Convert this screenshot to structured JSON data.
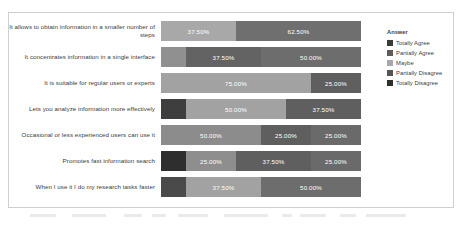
{
  "chart_data": {
    "type": "bar",
    "subtype": "horizontal-stacked-100-percent",
    "title": "",
    "xlabel": "",
    "ylabel": "",
    "grid": false,
    "xlim": [
      0,
      100
    ],
    "legend_position": "right",
    "legend_title": "Answer",
    "series": [
      {
        "name": "Totally Agree",
        "color": "#3a3a3a",
        "values": [
          0.0,
          0.0,
          0.0,
          0.0,
          0.0,
          0.0,
          0.0
        ]
      },
      {
        "name": "Partially Agree",
        "color": "#4f4f4f",
        "values": [
          0.0,
          12.5,
          0.0,
          12.5,
          0.0,
          12.5,
          12.5
        ]
      },
      {
        "name": "Maybe",
        "color": "#a8a8a8",
        "values": [
          37.5,
          37.5,
          75.0,
          50.0,
          50.0,
          25.0,
          37.5
        ]
      },
      {
        "name": "Partially Disagree",
        "color": "#6f6f6f",
        "values": [
          62.5,
          50.0,
          25.0,
          37.5,
          25.0,
          37.5,
          50.0
        ]
      },
      {
        "name": "Totally Disagree",
        "color": "#454545",
        "values": [
          0.0,
          0.0,
          0.0,
          0.0,
          25.0,
          25.0,
          0.0
        ]
      }
    ],
    "categories": [
      "It allows to obtain information in a smaller number of steps",
      "It concentrates information in a single interface",
      "It is suitable for regular users or experts",
      "Lets you analyze information more effectively",
      "Occasional or less experienced users can use it",
      "Promotes fast information search",
      "When I use it I do my research tasks faster"
    ]
  },
  "legend": {
    "title": "Answer",
    "items": [
      {
        "label": "Totally Agree",
        "color": "#3a3a3a"
      },
      {
        "label": "Partially Agree",
        "color": "#5c5c5c"
      },
      {
        "label": "Maybe",
        "color": "#a8a8a8"
      },
      {
        "label": "Partially Disagree",
        "color": "#555555"
      },
      {
        "label": "Totally Disagree",
        "color": "#2e2e2e"
      }
    ]
  },
  "rows": [
    {
      "category": "It allows to obtain information in a smaller number of steps",
      "segments": [
        {
          "series": "Maybe",
          "value": 37.5,
          "label": "37.50%",
          "color": "#a8a8a8",
          "show_label": true
        },
        {
          "series": "Partially Disagree",
          "value": 62.5,
          "label": "62.50%",
          "color": "#6f6f6f",
          "show_label": true
        }
      ]
    },
    {
      "category": "It concentrates information in a single interface",
      "segments": [
        {
          "series": "Partially Agree",
          "value": 12.5,
          "label": "12.50%",
          "color": "#909090",
          "show_label": false
        },
        {
          "series": "Maybe",
          "value": 37.5,
          "label": "37.50%",
          "color": "#636363",
          "show_label": true
        },
        {
          "series": "Partially Disagree",
          "value": 50.0,
          "label": "50.00%",
          "color": "#6d6d6d",
          "show_label": true
        }
      ]
    },
    {
      "category": "It is suitable for regular users or experts",
      "segments": [
        {
          "series": "Maybe",
          "value": 75.0,
          "label": "75.00%",
          "color": "#a2a2a2",
          "show_label": true
        },
        {
          "series": "Partially Disagree",
          "value": 25.0,
          "label": "25.00%",
          "color": "#5f5f5f",
          "show_label": true
        }
      ]
    },
    {
      "category": "Lets you analyze information more effectively",
      "segments": [
        {
          "series": "Partially Agree",
          "value": 12.5,
          "label": "12.50%",
          "color": "#3e3e3e",
          "show_label": false
        },
        {
          "series": "Maybe",
          "value": 50.0,
          "label": "50.00%",
          "color": "#a2a2a2",
          "show_label": true
        },
        {
          "series": "Partially Disagree",
          "value": 37.5,
          "label": "37.50%",
          "color": "#5f5f5f",
          "show_label": true
        }
      ]
    },
    {
      "category": "Occasional or less experienced users can use it",
      "segments": [
        {
          "series": "Maybe",
          "value": 50.0,
          "label": "50.00%",
          "color": "#8c8c8c",
          "show_label": true
        },
        {
          "series": "Partially Disagree",
          "value": 25.0,
          "label": "25.00%",
          "color": "#5f5f5f",
          "show_label": true
        },
        {
          "series": "Totally Disagree",
          "value": 25.0,
          "label": "25.00%",
          "color": "#6a6a6a",
          "show_label": true
        }
      ]
    },
    {
      "category": "Promotes fast information search",
      "segments": [
        {
          "series": "Partially Agree",
          "value": 12.5,
          "label": "12.50%",
          "color": "#2e2e2e",
          "show_label": false
        },
        {
          "series": "Maybe",
          "value": 25.0,
          "label": "25.00%",
          "color": "#8e8e8e",
          "show_label": true
        },
        {
          "series": "Partially Disagree",
          "value": 37.5,
          "label": "37.50%",
          "color": "#5f5f5f",
          "show_label": true
        },
        {
          "series": "Totally Disagree",
          "value": 25.0,
          "label": "25.00%",
          "color": "#6a6a6a",
          "show_label": true
        }
      ]
    },
    {
      "category": "When I use it I do my research tasks faster",
      "segments": [
        {
          "series": "Partially Agree",
          "value": 12.5,
          "label": "12.50%",
          "color": "#4a4a4a",
          "show_label": false
        },
        {
          "series": "Maybe",
          "value": 37.5,
          "label": "37.50%",
          "color": "#a2a2a2",
          "show_label": true
        },
        {
          "series": "Partially Disagree",
          "value": 50.0,
          "label": "50.00%",
          "color": "#6d6d6d",
          "show_label": true
        }
      ]
    }
  ]
}
